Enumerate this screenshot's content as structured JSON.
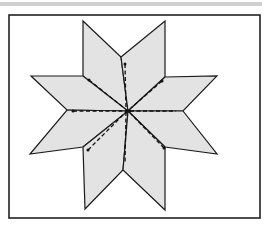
{
  "figure": {
    "colors": {
      "background": "#ffffff",
      "frame": "#222222",
      "diamond_fill": "#e3e3e3",
      "diamond_stroke": "#1a1a1a",
      "seam": "#111111",
      "top_bar": "#cfcfcf"
    },
    "frame": {
      "x": 9,
      "y": 15,
      "width": 251,
      "height": 203
    },
    "center": [
      128,
      111
    ],
    "diamonds": [
      {
        "name": "diamond-upper-left",
        "points": "83,21 121,57 128,111 83,76"
      },
      {
        "name": "diamond-upper-right",
        "points": "121,57 165,21 165,77 128,111"
      },
      {
        "name": "diamond-left-upper",
        "points": "31,76 83,76 128,111 67,110"
      },
      {
        "name": "diamond-right-upper",
        "points": "165,77 217,76 183,111 128,111"
      },
      {
        "name": "diamond-left-lower",
        "points": "67,110 128,111 83,147 30,154"
      },
      {
        "name": "diamond-right-lower",
        "points": "128,111 183,111 217,154 165,147"
      },
      {
        "name": "diamond-lower-left",
        "points": "83,147 128,111 123,170 85,209"
      },
      {
        "name": "diamond-lower-right",
        "points": "128,111 165,147 165,210 123,170"
      }
    ],
    "seams": [
      {
        "name": "seam-up",
        "x1": 125,
        "y1": 64,
        "x2": 126,
        "y2": 110
      },
      {
        "name": "seam-down",
        "x1": 126,
        "y1": 112,
        "x2": 125,
        "y2": 164
      },
      {
        "name": "seam-left",
        "x1": 73,
        "y1": 111,
        "x2": 126,
        "y2": 111
      },
      {
        "name": "seam-right",
        "x1": 130,
        "y1": 111,
        "x2": 176,
        "y2": 111
      },
      {
        "name": "seam-upper-left",
        "x1": 89,
        "y1": 80,
        "x2": 124,
        "y2": 108
      },
      {
        "name": "seam-upper-right",
        "x1": 162,
        "y1": 81,
        "x2": 131,
        "y2": 108
      },
      {
        "name": "seam-lower-left",
        "x1": 88,
        "y1": 150,
        "x2": 124,
        "y2": 114
      },
      {
        "name": "seam-lower-right",
        "x1": 164,
        "y1": 148,
        "x2": 131,
        "y2": 114
      }
    ]
  }
}
